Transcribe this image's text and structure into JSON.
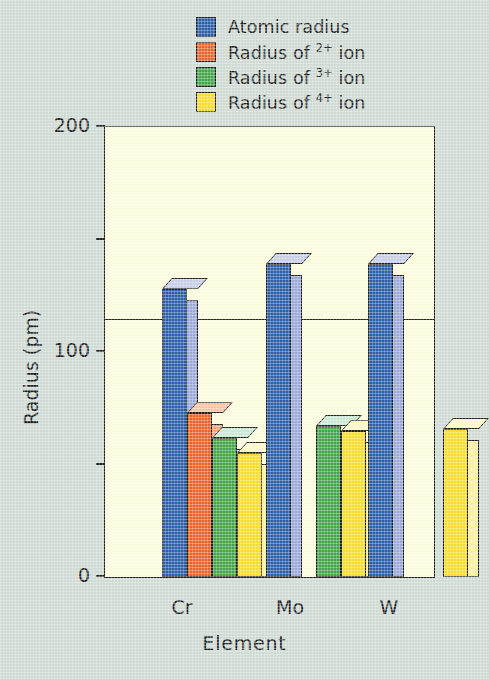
{
  "chart_data": {
    "type": "bar",
    "title": "",
    "xlabel": "Element",
    "ylabel": "Radius (pm)",
    "categories": [
      "Cr",
      "Mo",
      "W"
    ],
    "ylim": [
      0,
      200
    ],
    "yticks": [
      0,
      100,
      200
    ],
    "ytick_labels": [
      "0",
      "100",
      "200"
    ],
    "yminor_ticks": [
      50,
      150
    ],
    "grid": "horizontal line at 100",
    "legend_position": "above plot, left-aligned",
    "series": [
      {
        "name": "Atomic radius",
        "color": "#2d5fa8",
        "values": [
          128,
          139,
          139
        ]
      },
      {
        "name": "Radius of 2+ ion",
        "color": "#e8642c",
        "values": [
          73,
          null,
          null
        ]
      },
      {
        "name": "Radius of 3+ ion",
        "color": "#45a349",
        "values": [
          62,
          67,
          null
        ]
      },
      {
        "name": "Radius of 4+ ion",
        "color": "#f5dc2d",
        "values": [
          55,
          65,
          66
        ]
      }
    ]
  },
  "legend": {
    "items": [
      {
        "label_prefix": "Atomic radius",
        "charge": "",
        "label_suffix": "",
        "color": "#2d5fa8"
      },
      {
        "label_prefix": "Radius of ",
        "charge": "2+",
        "label_suffix": " ion",
        "color": "#e8642c"
      },
      {
        "label_prefix": "Radius of ",
        "charge": "3+",
        "label_suffix": " ion",
        "color": "#45a349"
      },
      {
        "label_prefix": "Radius of ",
        "charge": "4+",
        "label_suffix": " ion",
        "color": "#f5dc2d"
      }
    ]
  },
  "axes": {
    "y_title": "Radius (pm)",
    "x_title": "Element",
    "y_labels": [
      "200",
      "100",
      "0"
    ],
    "x_labels": [
      "Cr",
      "Mo",
      "W"
    ]
  },
  "colors": {
    "background": "#ced9d2",
    "plot_background": "#fbfbdc",
    "axis": "#23231d",
    "blue": "#2d5fa8",
    "blue_side": "#9aa8d8",
    "orange": "#e8642c",
    "orange_side": "#f5a277",
    "green": "#45a349",
    "green_side": "#a8d9bd",
    "yellow": "#f5dc2d",
    "yellow_side": "#faefa0"
  }
}
